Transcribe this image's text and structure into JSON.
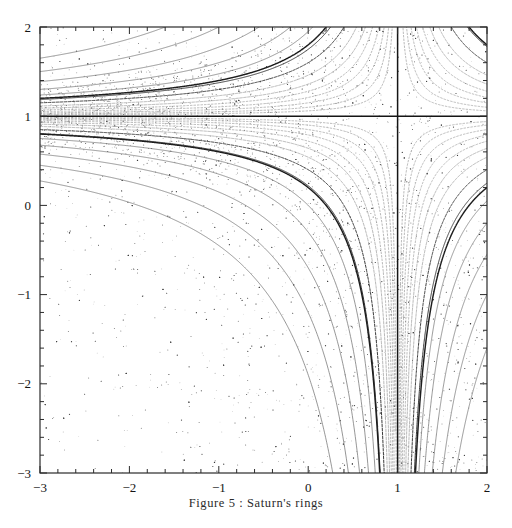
{
  "figure": {
    "caption": "Figure 5 : Saturn's rings",
    "background_color": "#ffffff",
    "frame_color": "#2b2b2b"
  },
  "chart_data": {
    "type": "scatter",
    "title": "Figure 5 : Saturn's rings",
    "xlabel": "",
    "ylabel": "",
    "xlim": [
      -3,
      2
    ],
    "ylim": [
      -3,
      2
    ],
    "grid": false,
    "legend": null,
    "x_ticks": [
      -3,
      -2,
      -1,
      0,
      1,
      2
    ],
    "x_tick_labels": [
      "-3",
      "-2",
      "-1",
      "0",
      "1",
      "2"
    ],
    "y_ticks": [
      -3,
      -2,
      -1,
      0,
      1,
      2
    ],
    "y_tick_labels": [
      "-3",
      "-2",
      "-1",
      "0",
      "1",
      "2"
    ],
    "minor_tick_step": 0.2,
    "tick_direction": "in",
    "point_color": "#555555",
    "point_size": 0.9,
    "scatter_point_count": 4200,
    "annotations": [
      {
        "name": "horizontal-invariant-line",
        "type": "line",
        "y": 1,
        "x_from": -3,
        "x_to": 2,
        "weight": "heavy"
      },
      {
        "name": "vertical-invariant-line",
        "type": "line",
        "x": 1,
        "y_from": -3,
        "y_to": 2,
        "weight": "heavy"
      },
      {
        "name": "dark-orbit-upper-right",
        "type": "curve",
        "description": "hyperbolic orbit crossing y=1 near x=0.15 and passing to lower right"
      },
      {
        "name": "dark-orbit-lower-left",
        "type": "curve",
        "description": "hyperbolic orbit entering left edge near y=-0.6 and exiting bottom edge near x=-0.55"
      }
    ],
    "series": [
      {
        "name": "invariant-curve-family",
        "description": "Nested hyperbola-like invariant curves of the rational map, accumulating toward the lines x=1 and y=1",
        "curve_parameters": [
          -2.6,
          -2.0,
          -1.55,
          -1.2,
          -0.95,
          -0.75,
          -0.6,
          -0.46,
          -0.36,
          -0.28,
          -0.21,
          -0.15,
          -0.1,
          -0.06,
          0.06,
          0.1,
          0.15,
          0.21,
          0.28,
          0.36,
          0.46,
          0.6,
          0.78,
          1.0,
          1.3,
          1.7,
          2.2,
          2.9
        ]
      },
      {
        "name": "scattered-orbit-points",
        "description": "Chaotic scattered orbit points filling the square, denser toward the lower-right quadrant near the invariant lines"
      }
    ]
  }
}
